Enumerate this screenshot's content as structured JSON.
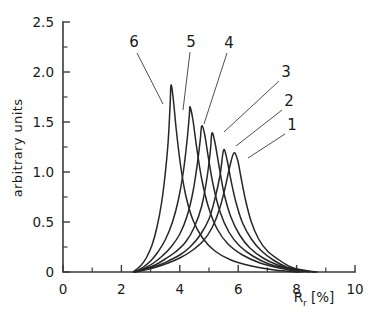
{
  "chart_data": {
    "type": "line",
    "title": "",
    "xlabel": "R_r  [%]",
    "xlabel_main": "R",
    "xlabel_sub": "r",
    "xlabel_unit": "[%]",
    "ylabel": "arbitrary units",
    "xlim": [
      0,
      10
    ],
    "ylim": [
      0,
      2.5
    ],
    "grid": false,
    "legend": "inline-numbered-labels",
    "xticks": [
      0,
      2,
      4,
      6,
      8,
      10
    ],
    "xticklabels": [
      "0",
      "2",
      "4",
      "6",
      "8",
      "10"
    ],
    "xminorticks": [
      1,
      3,
      5,
      7,
      9
    ],
    "yticks": [
      0,
      0.5,
      1.0,
      1.5,
      2.0,
      2.5
    ],
    "yticklabels": [
      "0",
      "0.5",
      "1.0",
      "1.5",
      "2.0",
      "2.5"
    ],
    "yminorticks": [
      0.25,
      0.75,
      1.25,
      1.75,
      2.25
    ],
    "series": [
      {
        "name": "1",
        "label": "1",
        "peak_x": 5.85,
        "peak_y": 1.19,
        "points": [
          [
            2.45,
            0.0
          ],
          [
            2.8,
            0.02
          ],
          [
            3.2,
            0.05
          ],
          [
            3.6,
            0.09
          ],
          [
            4.0,
            0.14
          ],
          [
            4.4,
            0.21
          ],
          [
            4.8,
            0.31
          ],
          [
            5.1,
            0.44
          ],
          [
            5.35,
            0.62
          ],
          [
            5.55,
            0.84
          ],
          [
            5.7,
            1.04
          ],
          [
            5.85,
            1.19
          ],
          [
            5.98,
            1.12
          ],
          [
            6.1,
            0.94
          ],
          [
            6.25,
            0.72
          ],
          [
            6.45,
            0.5
          ],
          [
            6.7,
            0.33
          ],
          [
            7.0,
            0.21
          ],
          [
            7.4,
            0.12
          ],
          [
            7.8,
            0.05
          ],
          [
            8.2,
            0.02
          ],
          [
            8.7,
            0.0
          ]
        ]
      },
      {
        "name": "2",
        "label": "2",
        "peak_x": 5.5,
        "peak_y": 1.22,
        "points": [
          [
            2.45,
            0.0
          ],
          [
            2.8,
            0.03
          ],
          [
            3.2,
            0.06
          ],
          [
            3.6,
            0.11
          ],
          [
            4.0,
            0.17
          ],
          [
            4.35,
            0.25
          ],
          [
            4.7,
            0.37
          ],
          [
            5.0,
            0.53
          ],
          [
            5.2,
            0.73
          ],
          [
            5.38,
            0.97
          ],
          [
            5.5,
            1.22
          ],
          [
            5.62,
            1.12
          ],
          [
            5.75,
            0.92
          ],
          [
            5.92,
            0.7
          ],
          [
            6.15,
            0.49
          ],
          [
            6.45,
            0.33
          ],
          [
            6.8,
            0.21
          ],
          [
            7.2,
            0.12
          ],
          [
            7.65,
            0.05
          ],
          [
            8.1,
            0.02
          ],
          [
            8.6,
            0.0
          ]
        ]
      },
      {
        "name": "3",
        "label": "3",
        "peak_x": 5.1,
        "peak_y": 1.39,
        "points": [
          [
            2.45,
            0.0
          ],
          [
            2.8,
            0.03
          ],
          [
            3.15,
            0.07
          ],
          [
            3.5,
            0.13
          ],
          [
            3.85,
            0.2
          ],
          [
            4.2,
            0.3
          ],
          [
            4.5,
            0.45
          ],
          [
            4.75,
            0.66
          ],
          [
            4.93,
            0.94
          ],
          [
            5.05,
            1.22
          ],
          [
            5.1,
            1.39
          ],
          [
            5.2,
            1.3
          ],
          [
            5.35,
            1.05
          ],
          [
            5.52,
            0.78
          ],
          [
            5.75,
            0.55
          ],
          [
            6.05,
            0.37
          ],
          [
            6.4,
            0.24
          ],
          [
            6.85,
            0.14
          ],
          [
            7.35,
            0.07
          ],
          [
            7.85,
            0.03
          ],
          [
            8.4,
            0.0
          ]
        ]
      },
      {
        "name": "4",
        "label": "4",
        "peak_x": 4.75,
        "peak_y": 1.46,
        "points": [
          [
            2.45,
            0.0
          ],
          [
            2.8,
            0.04
          ],
          [
            3.1,
            0.09
          ],
          [
            3.4,
            0.16
          ],
          [
            3.7,
            0.25
          ],
          [
            4.0,
            0.38
          ],
          [
            4.25,
            0.56
          ],
          [
            4.45,
            0.8
          ],
          [
            4.6,
            1.08
          ],
          [
            4.7,
            1.32
          ],
          [
            4.75,
            1.46
          ],
          [
            4.85,
            1.38
          ],
          [
            4.98,
            1.14
          ],
          [
            5.15,
            0.86
          ],
          [
            5.38,
            0.6
          ],
          [
            5.68,
            0.4
          ],
          [
            6.05,
            0.26
          ],
          [
            6.5,
            0.16
          ],
          [
            7.05,
            0.08
          ],
          [
            7.6,
            0.04
          ],
          [
            8.2,
            0.0
          ]
        ]
      },
      {
        "name": "5",
        "label": "5",
        "peak_x": 4.35,
        "peak_y": 1.65,
        "points": [
          [
            2.45,
            0.0
          ],
          [
            2.75,
            0.05
          ],
          [
            3.0,
            0.11
          ],
          [
            3.25,
            0.2
          ],
          [
            3.5,
            0.32
          ],
          [
            3.75,
            0.5
          ],
          [
            3.95,
            0.72
          ],
          [
            4.12,
            1.0
          ],
          [
            4.25,
            1.32
          ],
          [
            4.33,
            1.58
          ],
          [
            4.35,
            1.65
          ],
          [
            4.45,
            1.52
          ],
          [
            4.58,
            1.24
          ],
          [
            4.75,
            0.93
          ],
          [
            4.98,
            0.65
          ],
          [
            5.28,
            0.43
          ],
          [
            5.65,
            0.28
          ],
          [
            6.15,
            0.17
          ],
          [
            6.75,
            0.09
          ],
          [
            7.4,
            0.04
          ],
          [
            8.1,
            0.0
          ]
        ]
      },
      {
        "name": "6",
        "label": "6",
        "peak_x": 3.7,
        "peak_y": 1.87,
        "points": [
          [
            2.4,
            0.0
          ],
          [
            2.65,
            0.06
          ],
          [
            2.85,
            0.14
          ],
          [
            3.05,
            0.27
          ],
          [
            3.22,
            0.45
          ],
          [
            3.38,
            0.7
          ],
          [
            3.5,
            0.98
          ],
          [
            3.6,
            1.3
          ],
          [
            3.67,
            1.68
          ],
          [
            3.7,
            1.87
          ],
          [
            3.78,
            1.72
          ],
          [
            3.88,
            1.42
          ],
          [
            4.02,
            1.08
          ],
          [
            4.2,
            0.77
          ],
          [
            4.45,
            0.52
          ],
          [
            4.78,
            0.34
          ],
          [
            5.2,
            0.21
          ],
          [
            5.75,
            0.12
          ],
          [
            6.45,
            0.06
          ],
          [
            7.25,
            0.02
          ],
          [
            8.05,
            0.0
          ]
        ]
      }
    ],
    "annotations": [
      {
        "label": "1",
        "text_x": 292,
        "text_y": 130,
        "line": [
          [
            285,
            134
          ],
          [
            248,
            158
          ]
        ]
      },
      {
        "label": "2",
        "text_x": 289,
        "text_y": 106,
        "line": [
          [
            282,
            110
          ],
          [
            236,
            146
          ]
        ]
      },
      {
        "label": "3",
        "text_x": 286,
        "text_y": 77,
        "line": [
          [
            279,
            81
          ],
          [
            224,
            132
          ]
        ]
      },
      {
        "label": "4",
        "text_x": 229,
        "text_y": 48,
        "line": [
          [
            227,
            53
          ],
          [
            204,
            124
          ]
        ]
      },
      {
        "label": "5",
        "text_x": 191,
        "text_y": 47,
        "line": [
          [
            190,
            52
          ],
          [
            183,
            110
          ]
        ]
      },
      {
        "label": "6",
        "text_x": 134,
        "text_y": 47,
        "line": [
          [
            137,
            53
          ],
          [
            163,
            104
          ]
        ]
      }
    ]
  }
}
